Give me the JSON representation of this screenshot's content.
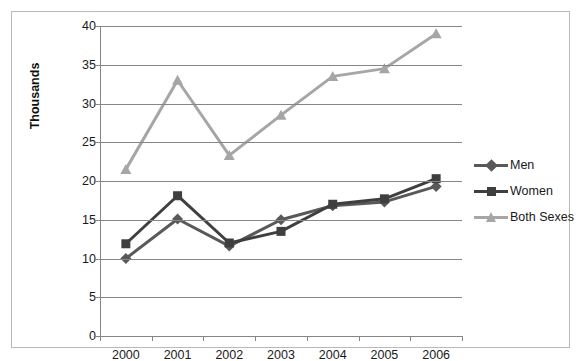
{
  "chart_data": {
    "type": "line",
    "title": "",
    "xlabel": "",
    "ylabel": "Thousands",
    "categories": [
      "2000",
      "2001",
      "2002",
      "2003",
      "2004",
      "2005",
      "2006"
    ],
    "ylim": [
      0,
      40
    ],
    "yticks": [
      0,
      5,
      10,
      15,
      20,
      25,
      30,
      35,
      40
    ],
    "ytick_labels": [
      "0",
      "5",
      "10",
      "15",
      "20",
      "25",
      "30",
      "35",
      "40"
    ],
    "grid": true,
    "legend_position": "right",
    "series": [
      {
        "name": "Men",
        "marker": "diamond",
        "color": "#595959",
        "values": [
          10.0,
          15.1,
          11.6,
          15.0,
          16.8,
          17.3,
          19.3
        ]
      },
      {
        "name": "Women",
        "marker": "square",
        "color": "#3f3f3f",
        "values": [
          11.9,
          18.1,
          12.0,
          13.5,
          17.0,
          17.7,
          20.3
        ]
      },
      {
        "name": "Both Sexes",
        "marker": "triangle",
        "color": "#a6a6a6",
        "values": [
          21.5,
          33.0,
          23.3,
          28.5,
          33.5,
          34.5,
          39.0
        ]
      }
    ]
  },
  "colors": {
    "axis": "#868686",
    "grid": "#868686",
    "border": "#b9b9b9",
    "text": "#1a1a1a",
    "background": "#ffffff"
  },
  "legend": {
    "items": [
      {
        "label": "Men"
      },
      {
        "label": "Women"
      },
      {
        "label": "Both Sexes"
      }
    ]
  }
}
